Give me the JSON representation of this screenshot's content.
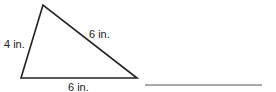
{
  "figure": {
    "shape": "triangle",
    "vertices": {
      "top": [
        43,
        5
      ],
      "bottom_left": [
        21,
        78
      ],
      "bottom_right": [
        137,
        78
      ]
    },
    "stroke_color": "#222222",
    "labels": {
      "left_side": "4 in.",
      "right_side": "6 in.",
      "base": "6 in."
    }
  },
  "answer_line": {
    "x1": 145,
    "x2": 262,
    "y": 85,
    "color": "#555555"
  }
}
